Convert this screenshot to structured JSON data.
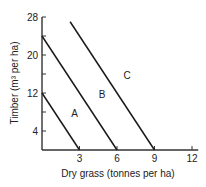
{
  "chart_data": {
    "type": "line",
    "title": "",
    "xlabel": "Dry grass (tonnes per ha)",
    "ylabel": "Timber (m³ per ha)",
    "xlim": [
      0,
      12.5
    ],
    "ylim": [
      0,
      28
    ],
    "x_ticks": [
      3,
      6,
      9,
      12
    ],
    "x_tick_labels": [
      "3",
      "6",
      "9",
      "12"
    ],
    "y_ticks": [
      4,
      8,
      12,
      16,
      20,
      24,
      28
    ],
    "y_tick_labels": [
      "4",
      "",
      "12",
      "",
      "20",
      "",
      "28"
    ],
    "grid": false,
    "legend": "inline labels",
    "series": [
      {
        "name": "A",
        "x": [
          0,
          3
        ],
        "y": [
          12,
          0
        ],
        "label_pos": [
          2.6,
          7
        ]
      },
      {
        "name": "B",
        "x": [
          0,
          6
        ],
        "y": [
          24,
          0
        ],
        "label_pos": [
          4.8,
          11
        ]
      },
      {
        "name": "C",
        "x": [
          2.25,
          9
        ],
        "y": [
          27,
          0
        ],
        "label_pos": [
          6.8,
          15
        ]
      }
    ]
  }
}
